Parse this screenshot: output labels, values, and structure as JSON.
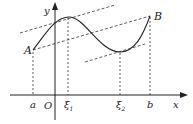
{
  "diagram": {
    "type": "mean-value-theorem-illustration",
    "axes": {
      "x_label": "x",
      "y_label": "y",
      "origin_label": "O"
    },
    "points": {
      "A": {
        "label": "A"
      },
      "B": {
        "label": "B"
      }
    },
    "x_ticks": [
      {
        "label": "a"
      },
      {
        "label": "ξ",
        "sub": "1"
      },
      {
        "label": "ξ",
        "sub": "2"
      },
      {
        "label": "b"
      }
    ],
    "colors": {
      "stroke": "#222222",
      "background": "#ffffff"
    }
  }
}
